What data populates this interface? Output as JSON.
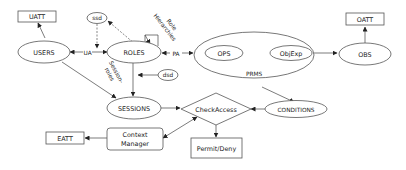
{
  "diagram": {
    "title": "",
    "nodes": {
      "uatt": "UATT",
      "users": "USERS",
      "ssd": "ssd",
      "roles": "ROLES",
      "role_hierarchies_line1": "Role",
      "role_hierarchies_line2": "Hierarchies",
      "dsd": "dsd",
      "sessions": "SESSIONS",
      "ops": "OPS",
      "objexp": "ObjExp",
      "prms": "PRMS",
      "obs": "OBS",
      "oatt": "OATT",
      "conditions": "CONDITIONS",
      "checkaccess": "CheckAccess",
      "permit_deny": "Permit/Deny",
      "context_manager_line1": "Context",
      "context_manager_line2": "Manager",
      "eatt": "EATT"
    },
    "edge_labels": {
      "ua": "UA",
      "pa": "PA",
      "session_roles_line1": "Session-",
      "session_roles_line2": "roles"
    },
    "edges": [
      {
        "from": "USERS",
        "to": "UATT",
        "style": "solid"
      },
      {
        "from": "USERS",
        "to": "ROLES",
        "label": "UA",
        "style": "solid",
        "bidirectional": true
      },
      {
        "from": "ssd",
        "to": "UA",
        "style": "dashed"
      },
      {
        "from": "ROLES",
        "to": "ssd",
        "style": "dashed"
      },
      {
        "from": "ROLES",
        "to": "ROLES",
        "label": "Role Hierarchies",
        "style": "solid"
      },
      {
        "from": "ROLES",
        "to": "PRMS",
        "label": "PA",
        "style": "solid",
        "bidirectional": true
      },
      {
        "from": "OPS",
        "to": "ObjExp",
        "style": "solid",
        "bidirectional": true
      },
      {
        "from": "ObjExp",
        "to": "OBS",
        "style": "solid"
      },
      {
        "from": "OBS",
        "to": "OATT",
        "style": "solid"
      },
      {
        "from": "ROLES",
        "to": "SESSIONS",
        "style": "solid"
      },
      {
        "from": "dsd",
        "to": "ROLES-SESSIONS",
        "style": "solid"
      },
      {
        "from": "USERS",
        "to": "SESSIONS",
        "label": "Session-roles",
        "style": "solid"
      },
      {
        "from": "PRMS",
        "to": "CONDITIONS",
        "style": "solid"
      },
      {
        "from": "SESSIONS",
        "to": "CheckAccess",
        "style": "solid"
      },
      {
        "from": "CONDITIONS",
        "to": "CheckAccess",
        "style": "solid"
      },
      {
        "from": "CheckAccess",
        "to": "Permit/Deny",
        "style": "solid"
      },
      {
        "from": "CheckAccess",
        "to": "Context Manager",
        "style": "solid",
        "bidirectional": true
      },
      {
        "from": "Context Manager",
        "to": "EATT",
        "style": "solid"
      }
    ]
  }
}
